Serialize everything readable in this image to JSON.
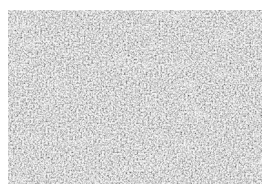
{
  "image": {
    "description": "Grayscale micrograph of densely packed tissue texture",
    "colors": {
      "background": "#ffffff",
      "base_gray": "#b8b8b8",
      "dark_gray": "#5a5a5a",
      "light_gray": "#e8e8e8"
    }
  }
}
